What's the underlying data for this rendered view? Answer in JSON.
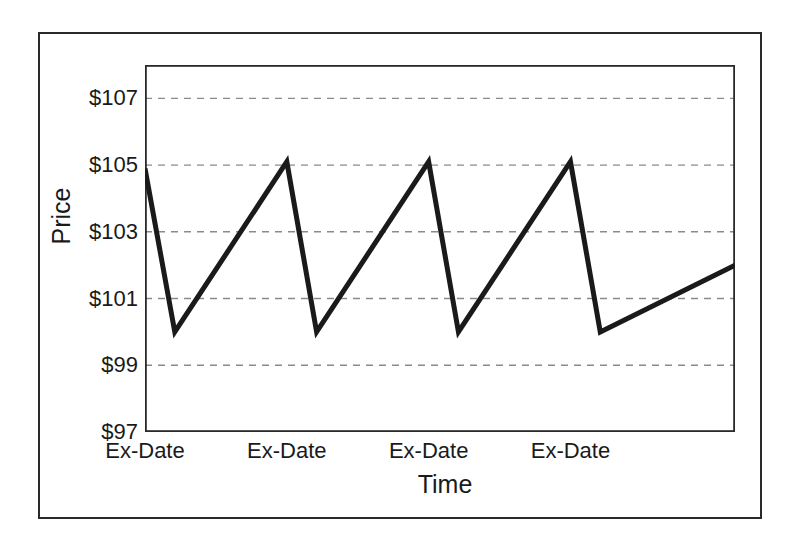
{
  "chart_data": {
    "type": "line",
    "title": "",
    "subtitle": "",
    "xlabel": "Time",
    "ylabel": "Price",
    "ylim": [
      97,
      108
    ],
    "xlim": [
      0,
      4.16
    ],
    "grid": true,
    "grid_style": "dashed-horizontal",
    "legend": "none",
    "ytick_labels": [
      "$107",
      "$105",
      "$103",
      "$101",
      "$99",
      "$97"
    ],
    "ytick_values": [
      107,
      105,
      103,
      101,
      99,
      97
    ],
    "xtick_labels": [
      "Ex-Date",
      "Ex-Date",
      "Ex-Date",
      "Ex-Date"
    ],
    "xtick_values": [
      0,
      1,
      2,
      3
    ],
    "series": [
      {
        "name": "Price",
        "color": "#1a1a1a",
        "line_width": 5,
        "x": [
          0,
          0.21,
          1.0,
          1.21,
          2.0,
          2.21,
          3.0,
          3.21,
          4.16
        ],
        "y": [
          104.9,
          100.0,
          105.1,
          100.0,
          105.1,
          100.0,
          105.1,
          100.0,
          102.0
        ]
      }
    ],
    "annotations": []
  },
  "figure": {
    "frame_color": "#2a2a2a",
    "axis_color": "#2a2a2a",
    "grid_color": "#8a8a8a",
    "background": "#ffffff"
  }
}
